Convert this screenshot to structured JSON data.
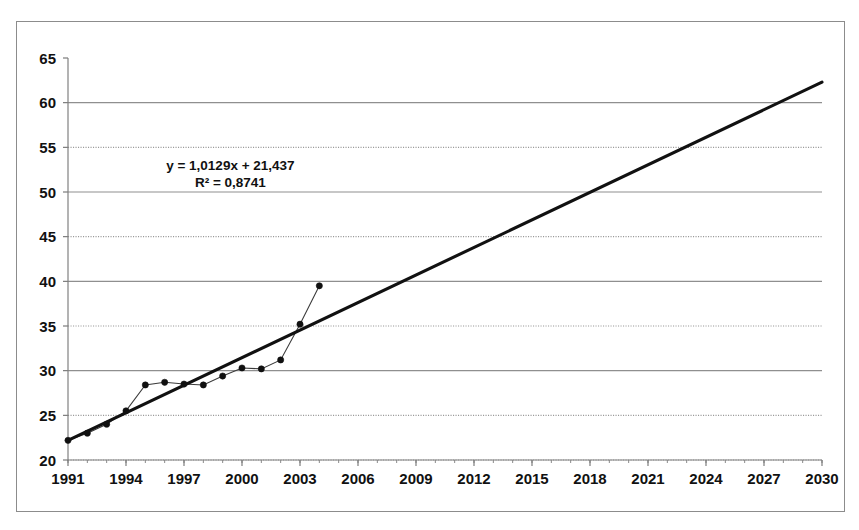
{
  "chart_data": {
    "type": "line",
    "title": "",
    "subtitle": "",
    "xlabel": "",
    "ylabel": "",
    "xlim": [
      1991,
      2030
    ],
    "ylim": [
      20,
      65
    ],
    "grid": true,
    "legend_position": "none",
    "y_ticks": [
      20,
      25,
      30,
      35,
      40,
      45,
      50,
      55,
      60,
      65
    ],
    "y_tick_labels": [
      "20",
      "25",
      "30",
      "35",
      "40",
      "45",
      "50",
      "55",
      "60",
      "65"
    ],
    "y_grid_styles": {
      "25": "dotted",
      "30": "solid",
      "35": "dotted",
      "40": "solid",
      "45": "dotted",
      "50": "solid",
      "55": "dotted",
      "60": "solid"
    },
    "x_ticks": [
      1991,
      1994,
      1997,
      2000,
      2003,
      2006,
      2009,
      2012,
      2015,
      2018,
      2021,
      2024,
      2027,
      2030
    ],
    "x_tick_labels": [
      "1991",
      "1994",
      "1997",
      "2000",
      "2003",
      "2006",
      "2009",
      "2012",
      "2015",
      "2018",
      "2021",
      "2024",
      "2027",
      "2030"
    ],
    "x_minor_tick_step": 1,
    "series": [
      {
        "name": "observed",
        "style": "line-markers",
        "color": "#101010",
        "x": [
          1991,
          1992,
          1993,
          1994,
          1995,
          1996,
          1997,
          1998,
          1999,
          2000,
          2001,
          2002,
          2003,
          2004
        ],
        "values": [
          22.2,
          23.0,
          24.0,
          25.5,
          28.4,
          28.7,
          28.5,
          28.4,
          29.4,
          30.3,
          30.2,
          31.2,
          35.2,
          39.5
        ]
      },
      {
        "name": "linear-trend",
        "style": "line",
        "color": "#111111",
        "x": [
          1991,
          2030
        ],
        "values": [
          22.2,
          62.3
        ]
      }
    ],
    "annotations": [
      {
        "name": "regression-equation",
        "lines": [
          "y = 1,0129x + 21,437",
          "R² = 0,8741"
        ],
        "x": 1999.4,
        "y": 52.5
      }
    ],
    "trendline": {
      "equation": "y = 1,0129x + 21,437",
      "r_squared": "R² = 0,8741",
      "slope": 1.0129,
      "intercept": 21.437,
      "r2_value": 0.8741
    }
  }
}
